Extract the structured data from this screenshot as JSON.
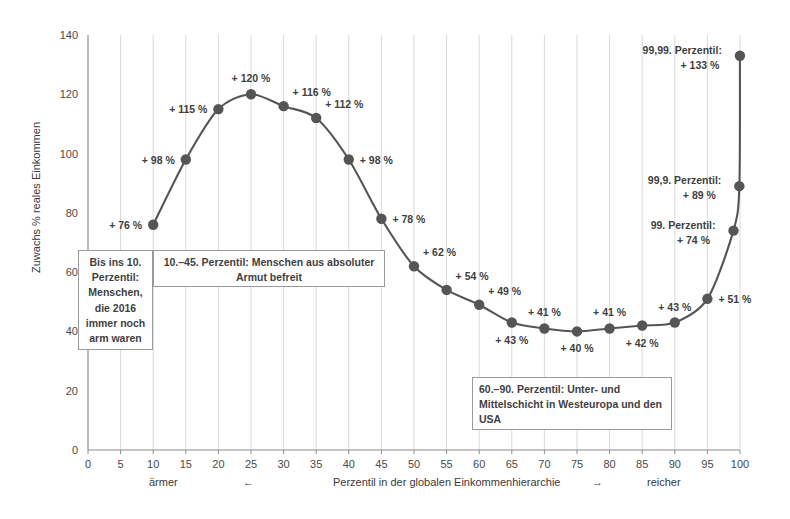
{
  "chart_data": {
    "type": "line",
    "title": "",
    "xlabel": "Perzentil in der globalen Einkommenhierarchie",
    "ylabel": "Zuwachs % reales Einkommen",
    "xlim": [
      0,
      100
    ],
    "ylim": [
      0,
      140
    ],
    "grid": true,
    "legend": "none",
    "x_ticks": [
      0,
      5,
      10,
      15,
      20,
      25,
      30,
      35,
      40,
      45,
      50,
      55,
      60,
      65,
      70,
      75,
      80,
      85,
      90,
      95,
      100
    ],
    "y_ticks": [
      0,
      20,
      40,
      60,
      80,
      100,
      120,
      140
    ],
    "x": [
      10,
      15,
      20,
      25,
      30,
      35,
      40,
      45,
      50,
      55,
      60,
      65,
      70,
      75,
      80,
      85,
      90,
      95,
      99,
      99.9,
      99.99
    ],
    "values": [
      76,
      98,
      115,
      120,
      116,
      112,
      98,
      78,
      62,
      54,
      49,
      43,
      41,
      40,
      41,
      42,
      43,
      51,
      74,
      89,
      133
    ],
    "point_labels": [
      {
        "x": 10,
        "y": 76,
        "text": "+ 76 %",
        "pos": "left"
      },
      {
        "x": 15,
        "y": 98,
        "text": "+ 98 %",
        "pos": "left"
      },
      {
        "x": 20,
        "y": 115,
        "text": "+ 115 %",
        "pos": "left"
      },
      {
        "x": 25,
        "y": 120,
        "text": "+ 120 %",
        "pos": "above"
      },
      {
        "x": 30,
        "y": 116,
        "text": "+ 116 %",
        "pos": "above-right"
      },
      {
        "x": 35,
        "y": 112,
        "text": "+ 112 %",
        "pos": "above-right"
      },
      {
        "x": 40,
        "y": 98,
        "text": "+ 98 %",
        "pos": "right"
      },
      {
        "x": 45,
        "y": 78,
        "text": "+ 78 %",
        "pos": "right"
      },
      {
        "x": 50,
        "y": 62,
        "text": "+ 62 %",
        "pos": "above-right"
      },
      {
        "x": 55,
        "y": 54,
        "text": "+ 54 %",
        "pos": "above-right"
      },
      {
        "x": 60,
        "y": 49,
        "text": "+ 49 %",
        "pos": "above-right"
      },
      {
        "x": 65,
        "y": 43,
        "text": "+ 43 %",
        "pos": "below"
      },
      {
        "x": 70,
        "y": 41,
        "text": "+ 41 %",
        "pos": "above"
      },
      {
        "x": 75,
        "y": 40,
        "text": "+ 40 %",
        "pos": "below"
      },
      {
        "x": 80,
        "y": 41,
        "text": "+ 41 %",
        "pos": "above"
      },
      {
        "x": 85,
        "y": 42,
        "text": "+ 42 %",
        "pos": "below"
      },
      {
        "x": 90,
        "y": 43,
        "text": "+ 43 %",
        "pos": "above"
      },
      {
        "x": 95,
        "y": 51,
        "text": "+ 51 %",
        "pos": "right"
      }
    ],
    "callouts": [
      {
        "line1": "99. Perzentil:",
        "line2": "+ 74 %",
        "x": 99,
        "y": 74
      },
      {
        "line1": "99,9. Perzentil:",
        "line2": "+ 89 %",
        "x": 99.9,
        "y": 89
      },
      {
        "line1": "99,99. Perzentil:",
        "line2": "+ 133 %",
        "x": 99.99,
        "y": 133
      }
    ],
    "annotations": [
      {
        "id": "note-poor",
        "text": "Bis ins 10. Perzentil: Menschen, die 2016 immer noch arm waren"
      },
      {
        "id": "note-absolute",
        "text": "10.–45. Perzentil: Menschen aus absoluter Armut befreit"
      },
      {
        "id": "note-middle",
        "text": "60.–90. Perzentil: Unter- und Mittelschicht in Westeuropa und den USA"
      }
    ],
    "colors": {
      "line": "#555555",
      "marker": "#555555",
      "grid": "#d9d9d9",
      "axis": "#8c8c8c",
      "text": "#3f3f3f"
    }
  },
  "axis_footer": {
    "poorer": "ärmer",
    "left_arrow": "←",
    "center": "Perzentil in der globalen Einkommenhierarchie",
    "right_arrow": "→",
    "richer": "reicher"
  }
}
